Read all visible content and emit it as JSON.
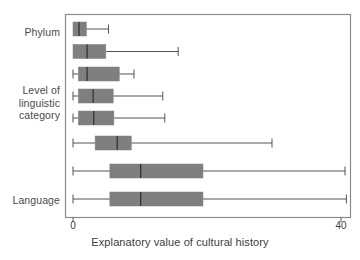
{
  "chart_data": {
    "type": "boxplot",
    "orientation": "horizontal",
    "title": "",
    "xlabel": "Explanatory value of cultural history",
    "ylabel": "",
    "xlim": [
      -1.2,
      41.4
    ],
    "xticks": [
      0,
      40
    ],
    "xticklabels": [
      "0",
      "40"
    ],
    "grid": false,
    "legend": null,
    "group_labels": [
      "Phylum",
      "Level of\nlinguistic\ncategory",
      "Language"
    ],
    "box_color": "#7f7f7f",
    "line_color": "#3f3f3f",
    "frame_color": "#8c8c8c",
    "boxes": [
      {
        "name": "Phylum",
        "whisker_low": 0.0,
        "q1": 0.0,
        "median": 0.9,
        "q3": 2.0,
        "whisker_high": 5.3
      },
      {
        "name": "row-2",
        "whisker_low": 0.0,
        "q1": 0.0,
        "median": 2.1,
        "q3": 4.9,
        "whisker_high": 15.7
      },
      {
        "name": "row-3",
        "whisker_low": 0.0,
        "q1": 0.8,
        "median": 2.1,
        "q3": 6.9,
        "whisker_high": 9.1
      },
      {
        "name": "row-4",
        "whisker_low": 0.0,
        "q1": 0.8,
        "median": 3.0,
        "q3": 6.0,
        "whisker_high": 13.4
      },
      {
        "name": "row-5",
        "whisker_low": 0.0,
        "q1": 0.8,
        "median": 3.1,
        "q3": 6.1,
        "whisker_high": 13.7
      },
      {
        "name": "row-6",
        "whisker_low": 0.0,
        "q1": 3.3,
        "median": 6.6,
        "q3": 8.7,
        "whisker_high": 29.7
      },
      {
        "name": "row-7",
        "whisker_low": 0.0,
        "q1": 5.5,
        "median": 10.1,
        "q3": 19.4,
        "whisker_high": 40.6
      },
      {
        "name": "Language",
        "whisker_low": 0.0,
        "q1": 5.5,
        "median": 10.1,
        "q3": 19.4,
        "whisker_high": 40.8
      }
    ]
  },
  "axis": {
    "xlabel": "Explanatory value of cultural history",
    "tick_0": "0",
    "tick_40": "40"
  },
  "ylabels": {
    "top": "Phylum",
    "middle": "Level of\nlinguistic\ncategory",
    "bottom": "Language"
  }
}
